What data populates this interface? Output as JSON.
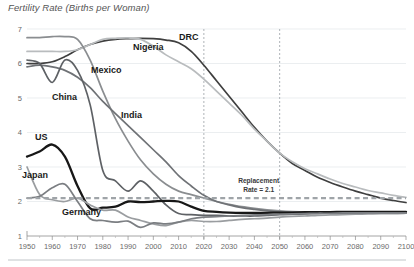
{
  "chart_data": {
    "type": "line",
    "title": "Fertility Rate (Births per Woman)",
    "xlabel": "",
    "ylabel": "",
    "xlim": [
      1950,
      2100
    ],
    "ylim": [
      1,
      7
    ],
    "grid": true,
    "legend_position": "inline-labels",
    "x_ticks": [
      "1950",
      "1960",
      "1970",
      "1980",
      "1990",
      "2000",
      "2010",
      "2020",
      "2030",
      "2040",
      "2050",
      "2060",
      "2070",
      "2080",
      "2090",
      "2100"
    ],
    "y_ticks": [
      "1",
      "2",
      "3",
      "4",
      "5",
      "6",
      "7"
    ],
    "annotations": [
      {
        "name": "replacement-rate",
        "line1": "Replacement",
        "line2": "Rate = 2.1",
        "value": 2.1
      },
      {
        "name": "vertical-marker-2020",
        "x": 2020
      },
      {
        "name": "vertical-marker-2050",
        "x": 2050
      }
    ],
    "x": [
      1950,
      1955,
      1960,
      1965,
      1970,
      1975,
      1980,
      1985,
      1990,
      1995,
      2000,
      2005,
      2010,
      2015,
      2020,
      2025,
      2030,
      2035,
      2040,
      2045,
      2050,
      2055,
      2060,
      2065,
      2070,
      2075,
      2080,
      2085,
      2090,
      2095,
      2100
    ],
    "series": [
      {
        "name": "DRC",
        "label": "DRC",
        "color": "#3f3f3f",
        "values": [
          6.0,
          6.0,
          6.05,
          6.2,
          6.4,
          6.55,
          6.65,
          6.7,
          6.72,
          6.73,
          6.72,
          6.68,
          6.6,
          6.35,
          5.95,
          5.5,
          5.05,
          4.6,
          4.15,
          3.75,
          3.4,
          3.1,
          2.9,
          2.7,
          2.55,
          2.42,
          2.3,
          2.2,
          2.1,
          2.03,
          1.97
        ]
      },
      {
        "name": "Nigeria",
        "label": "Nigeria",
        "color": "#b9bcbe",
        "values": [
          6.35,
          6.35,
          6.35,
          6.35,
          6.4,
          6.55,
          6.7,
          6.73,
          6.74,
          6.7,
          6.5,
          6.25,
          6.05,
          5.85,
          5.55,
          5.2,
          4.85,
          4.5,
          4.1,
          3.75,
          3.4,
          3.15,
          2.95,
          2.8,
          2.65,
          2.52,
          2.42,
          2.32,
          2.25,
          2.18,
          2.12
        ]
      },
      {
        "name": "Mexico",
        "label": "Mexico",
        "color": "#8a8d90",
        "values": [
          6.75,
          6.75,
          6.78,
          6.78,
          6.7,
          6.1,
          5.2,
          4.4,
          3.75,
          3.2,
          2.8,
          2.5,
          2.3,
          2.2,
          2.1,
          2.0,
          1.92,
          1.85,
          1.8,
          1.76,
          1.73,
          1.71,
          1.7,
          1.69,
          1.68,
          1.68,
          1.67,
          1.67,
          1.67,
          1.67,
          1.67
        ]
      },
      {
        "name": "India",
        "label": "India",
        "color": "#6f7276",
        "values": [
          5.9,
          5.95,
          5.9,
          5.8,
          5.6,
          5.3,
          4.9,
          4.55,
          4.2,
          3.85,
          3.5,
          3.15,
          2.75,
          2.45,
          2.18,
          2.0,
          1.9,
          1.82,
          1.77,
          1.73,
          1.7,
          1.69,
          1.68,
          1.68,
          1.67,
          1.67,
          1.67,
          1.67,
          1.67,
          1.67,
          1.67
        ]
      },
      {
        "name": "China",
        "label": "China",
        "color": "#5e6165",
        "values": [
          6.1,
          6.0,
          5.45,
          6.1,
          5.8,
          4.8,
          2.9,
          2.6,
          2.3,
          2.6,
          2.3,
          1.9,
          1.65,
          1.62,
          1.6,
          1.6,
          1.58,
          1.58,
          1.58,
          1.6,
          1.62,
          1.63,
          1.64,
          1.65,
          1.66,
          1.66,
          1.67,
          1.67,
          1.67,
          1.67,
          1.67
        ]
      },
      {
        "name": "US",
        "label": "US",
        "color": "#171717",
        "values": [
          3.3,
          3.45,
          3.65,
          3.3,
          2.45,
          1.8,
          1.82,
          1.85,
          2.0,
          1.98,
          2.0,
          2.02,
          2.0,
          1.85,
          1.73,
          1.7,
          1.68,
          1.67,
          1.67,
          1.67,
          1.68,
          1.68,
          1.69,
          1.69,
          1.69,
          1.7,
          1.7,
          1.7,
          1.7,
          1.7,
          1.7
        ]
      },
      {
        "name": "Japan",
        "label": "Japan",
        "color": "#9a9da0",
        "values": [
          3.0,
          2.2,
          2.05,
          2.0,
          2.1,
          1.9,
          1.75,
          1.75,
          1.55,
          1.45,
          1.35,
          1.3,
          1.4,
          1.45,
          1.42,
          1.42,
          1.45,
          1.48,
          1.5,
          1.52,
          1.55,
          1.57,
          1.58,
          1.6,
          1.61,
          1.62,
          1.63,
          1.64,
          1.65,
          1.65,
          1.66
        ]
      },
      {
        "name": "Germany",
        "label": "Germany",
        "color": "#7b7e82",
        "values": [
          2.1,
          2.15,
          2.4,
          2.5,
          2.0,
          1.5,
          1.45,
          1.4,
          1.43,
          1.25,
          1.38,
          1.35,
          1.4,
          1.5,
          1.55,
          1.56,
          1.58,
          1.6,
          1.61,
          1.62,
          1.63,
          1.64,
          1.65,
          1.66,
          1.66,
          1.67,
          1.67,
          1.67,
          1.67,
          1.67,
          1.67
        ]
      }
    ],
    "series_label_positions": [
      {
        "name": "DRC",
        "x": 179,
        "y": 40
      },
      {
        "name": "Nigeria",
        "x": 133,
        "y": 50
      },
      {
        "name": "Mexico",
        "x": 91,
        "y": 73
      },
      {
        "name": "China",
        "x": 52,
        "y": 100
      },
      {
        "name": "India",
        "x": 121,
        "y": 118
      },
      {
        "name": "US",
        "x": 35,
        "y": 140
      },
      {
        "name": "Japan",
        "x": 22,
        "y": 178
      },
      {
        "name": "Germany",
        "x": 62,
        "y": 215
      }
    ]
  }
}
